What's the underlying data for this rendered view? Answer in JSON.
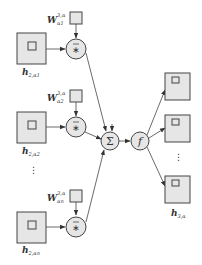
{
  "diagram": {
    "inputs": [
      {
        "label_main": "h",
        "label_sub": "2,α1",
        "weight_main": "W",
        "weight_sup": "3,α",
        "weight_sub": "α1",
        "op": "∗̄"
      },
      {
        "label_main": "h",
        "label_sub": "2,α2",
        "weight_main": "W",
        "weight_sup": "3,α",
        "weight_sub": "α2",
        "op": "∗̄"
      },
      {
        "label_main": "h",
        "label_sub": "2,αn",
        "weight_main": "W",
        "weight_sup": "3,α",
        "weight_sub": "αn",
        "op": "∗̄"
      }
    ],
    "ellipsis_vertical": "⋮",
    "sum_node": {
      "symbol": "Σ"
    },
    "activation_node": {
      "symbol": "f"
    },
    "output": {
      "label_main": "h",
      "label_sub": "3,α",
      "count_visible": 3
    },
    "colors": {
      "fill": "#e6e6e6",
      "stroke": "#444444",
      "text": "#333333"
    }
  }
}
